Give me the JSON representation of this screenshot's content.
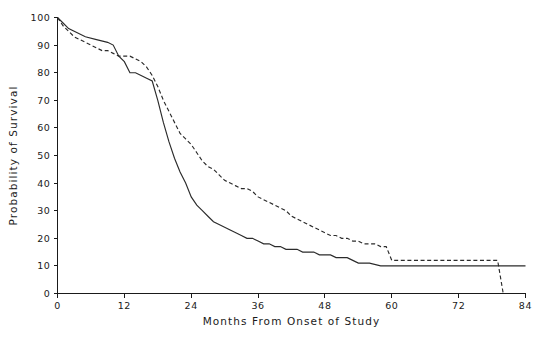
{
  "figure": {
    "width": 547,
    "height": 345,
    "background": "#ffffff",
    "ink_color": "#2b2b2b"
  },
  "caption": {
    "text": "",
    "note": "faint cropped text fragment at very bottom edge"
  },
  "chart_data": {
    "type": "line",
    "title": "",
    "subtitle": "",
    "xlabel": "Months From Onset of Study",
    "ylabel": "Probability of Survival",
    "xlim": [
      0,
      84
    ],
    "ylim": [
      0,
      100
    ],
    "xticks": [
      0,
      12,
      24,
      36,
      48,
      60,
      72,
      84
    ],
    "xticklabels": [
      "0",
      "12",
      "24",
      "36",
      "48",
      "60",
      "72",
      "84"
    ],
    "yticks": [
      0,
      10,
      20,
      30,
      40,
      50,
      60,
      70,
      80,
      90,
      100
    ],
    "yticklabels": [
      "0",
      "10",
      "20",
      "30",
      "40",
      "50",
      "60",
      "70",
      "80",
      "90",
      "100"
    ],
    "grid": false,
    "legend": false,
    "legend_position": "none",
    "step_style": "kaplan-meier survival step curves",
    "series": [
      {
        "name": "solid-curve",
        "style": "solid",
        "color": "#2b2b2b",
        "x": [
          0,
          1,
          2,
          3,
          5,
          7,
          9,
          10,
          11,
          12,
          13,
          14,
          15,
          16,
          17,
          18,
          19,
          20,
          21,
          22,
          23,
          24,
          25,
          26,
          27,
          28,
          29,
          30,
          31,
          32,
          33,
          34,
          35,
          36,
          37,
          38,
          39,
          40,
          41,
          42,
          43,
          44,
          45,
          46,
          47,
          48,
          49,
          50,
          51,
          52,
          53,
          54,
          56,
          58,
          60,
          66,
          72,
          78,
          84
        ],
        "y": [
          100,
          98,
          96,
          95,
          93,
          92,
          91,
          90,
          86,
          84,
          80,
          80,
          79,
          78,
          77,
          70,
          62,
          55,
          49,
          44,
          40,
          35,
          32,
          30,
          28,
          26,
          25,
          24,
          23,
          22,
          21,
          20,
          20,
          19,
          18,
          18,
          17,
          17,
          16,
          16,
          16,
          15,
          15,
          15,
          14,
          14,
          14,
          13,
          13,
          13,
          12,
          11,
          11,
          10,
          10,
          10,
          10,
          10,
          10
        ]
      },
      {
        "name": "dashed-curve",
        "style": "dashed",
        "color": "#2b2b2b",
        "x": [
          0,
          1,
          2,
          3,
          4,
          5,
          6,
          7,
          8,
          9,
          10,
          11,
          12,
          13,
          14,
          15,
          16,
          17,
          18,
          19,
          20,
          21,
          22,
          23,
          24,
          25,
          26,
          27,
          28,
          29,
          30,
          31,
          32,
          33,
          34,
          35,
          36,
          37,
          38,
          39,
          40,
          41,
          42,
          43,
          44,
          45,
          46,
          47,
          48,
          49,
          50,
          51,
          52,
          53,
          54,
          55,
          56,
          57,
          58,
          59,
          60,
          66,
          72,
          78,
          79,
          80
        ],
        "y": [
          100,
          97,
          95,
          93,
          92,
          91,
          90,
          89,
          88,
          88,
          87,
          86,
          86,
          86,
          85,
          84,
          82,
          79,
          75,
          70,
          66,
          62,
          58,
          56,
          54,
          51,
          48,
          46,
          45,
          43,
          41,
          40,
          39,
          38,
          38,
          37,
          35,
          34,
          33,
          32,
          31,
          30,
          28,
          27,
          26,
          25,
          24,
          23,
          22,
          21,
          21,
          20,
          20,
          19,
          19,
          18,
          18,
          18,
          17,
          17,
          12,
          12,
          12,
          12,
          12,
          0
        ]
      }
    ],
    "annotations": [
      {
        "text": "dashed curve drops vertically to 0 at month 80",
        "x": 80,
        "y": 0
      }
    ]
  }
}
